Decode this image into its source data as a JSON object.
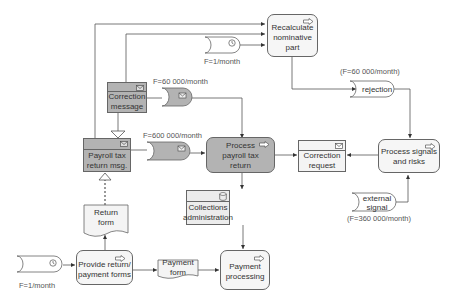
{
  "diagram": {
    "colors": {
      "dark_fill": "#b3b3b3",
      "light_fill": "#f6f6f6",
      "stroke": "#666666",
      "text": "#333333"
    },
    "nodes": {
      "recalculate": {
        "label": "Recalculate nominative part",
        "type": "process",
        "icon": "arrow-right-icon"
      },
      "correction_message": {
        "label": "Correction message",
        "type": "message",
        "icon": "envelope-icon"
      },
      "payroll_tax_return_msg": {
        "label": "Payroll tax return msg.",
        "type": "message",
        "icon": "envelope-icon"
      },
      "process_payroll": {
        "label": "Process payroll tax return",
        "type": "process",
        "icon": "arrow-right-icon"
      },
      "correction_request": {
        "label": "Correction request",
        "type": "message",
        "icon": "envelope-icon"
      },
      "process_signals": {
        "label": "Process signals and risks",
        "type": "process",
        "icon": "arrow-right-icon"
      },
      "collections_admin": {
        "label": "Collections administration",
        "type": "datastore",
        "icon": "database-icon"
      },
      "payment_processing": {
        "label": "Payment processing",
        "type": "process",
        "icon": "arrow-right-icon"
      },
      "return_form": {
        "label": "Return form",
        "type": "document"
      },
      "provide_forms": {
        "label": "Provide return/ payment forms",
        "type": "process",
        "icon": "arrow-right-icon"
      },
      "payment_form": {
        "label": "Payment form",
        "type": "document"
      }
    },
    "events": {
      "timer_top": {
        "freq": "F=1/month",
        "icon": "clock-icon"
      },
      "msg_event_60k": {
        "freq": "F=60 000/month",
        "icon": "envelope-icon"
      },
      "msg_event_600k": {
        "freq": "F=600 000/month",
        "icon": "envelope-icon"
      },
      "rejection": {
        "label": "rejection",
        "freq": "(F=60 000/month)"
      },
      "external_signal": {
        "label": "external signal",
        "freq": "(F=360 000/month)"
      },
      "timer_bottom": {
        "freq": "F=1/month",
        "icon": "clock-icon"
      }
    }
  }
}
